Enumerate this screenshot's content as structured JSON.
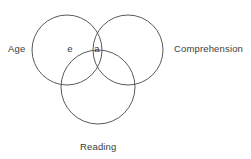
{
  "figure": {
    "type": "venn-diagram-3-set",
    "background_color": "#ffffff",
    "stroke_color": "#5a5a5a",
    "text_color": "#3c3c3c"
  },
  "sets": [
    {
      "key": "age",
      "label": "Age",
      "label_position": "left",
      "cx": 67,
      "cy": 50,
      "r": 35
    },
    {
      "key": "comprehension",
      "label": "Comprehension",
      "label_position": "right",
      "cx": 128,
      "cy": 50,
      "r": 35
    },
    {
      "key": "reading",
      "label": "Reading",
      "label_position": "bottom",
      "cx": 98,
      "cy": 87,
      "r": 37
    }
  ],
  "region_labels": [
    {
      "key": "age-only",
      "text": "e",
      "region": "Age only"
    },
    {
      "key": "age-comprehension",
      "text": "a",
      "region": "Age and Comprehension overlap"
    }
  ]
}
